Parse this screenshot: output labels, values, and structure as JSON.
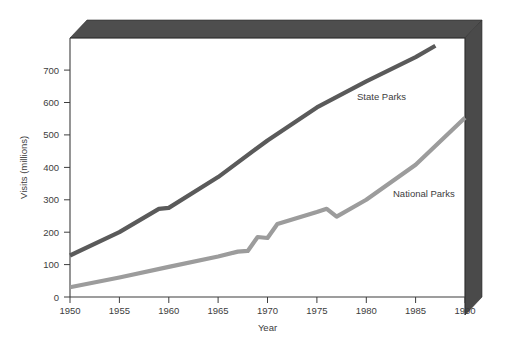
{
  "chart_data": {
    "type": "line",
    "title": "",
    "xlabel": "Year",
    "ylabel": "Visits (millions)",
    "xlim": [
      1950,
      1990
    ],
    "ylim": [
      0,
      780
    ],
    "xticks": [
      1950,
      1955,
      1960,
      1965,
      1970,
      1975,
      1980,
      1985,
      1990
    ],
    "yticks": [
      0,
      100,
      200,
      300,
      400,
      500,
      600,
      700
    ],
    "grid": false,
    "legend_position": "inline-annotation",
    "series": [
      {
        "name": "State Parks",
        "color": "#5a5a5a",
        "x": [
          1950,
          1955,
          1959,
          1960,
          1965,
          1970,
          1975,
          1980,
          1985,
          1987
        ],
        "values": [
          128,
          200,
          272,
          275,
          370,
          483,
          585,
          665,
          740,
          775
        ]
      },
      {
        "name": "National Parks",
        "color": "#9c9c9c",
        "x": [
          1950,
          1955,
          1960,
          1965,
          1967,
          1968,
          1969,
          1970,
          1971,
          1975,
          1976,
          1977,
          1980,
          1985,
          1990
        ],
        "values": [
          30,
          60,
          93,
          125,
          140,
          142,
          185,
          182,
          225,
          262,
          272,
          248,
          300,
          408,
          553
        ]
      }
    ]
  },
  "axis": {
    "y_title": "Visits (millions)",
    "x_title": "Year",
    "y_tick_labels": [
      "700",
      "600",
      "500",
      "400",
      "300",
      "200",
      "100",
      "0"
    ],
    "x_tick_labels": [
      "1950",
      "1955",
      "1960",
      "1965",
      "1970",
      "1975",
      "1980",
      "1985",
      "1990"
    ]
  },
  "annotations": {
    "state_parks_label": "State Parks",
    "national_parks_label": "National Parks"
  },
  "colors": {
    "state_parks": "#5a5a5a",
    "national_parks": "#9c9c9c",
    "frame_top": "#4e4e4e",
    "frame_right": "#4a4a4a",
    "frame_bevel": "#6a6a6a",
    "axis": "#3d3d3d",
    "background": "#ffffff"
  }
}
